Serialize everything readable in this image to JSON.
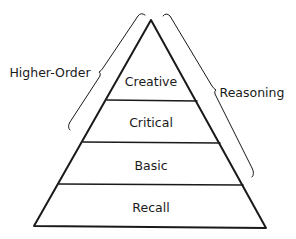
{
  "diagram": {
    "type": "pyramid",
    "tiers": [
      {
        "label": "Creative"
      },
      {
        "label": "Critical"
      },
      {
        "label": "Basic"
      },
      {
        "label": "Recall"
      }
    ],
    "brace_left": {
      "label": "Higher-Order"
    },
    "brace_right": {
      "label": "Reasoning"
    },
    "colors": {
      "stroke": "#1a1a1a",
      "background": "#ffffff"
    }
  }
}
